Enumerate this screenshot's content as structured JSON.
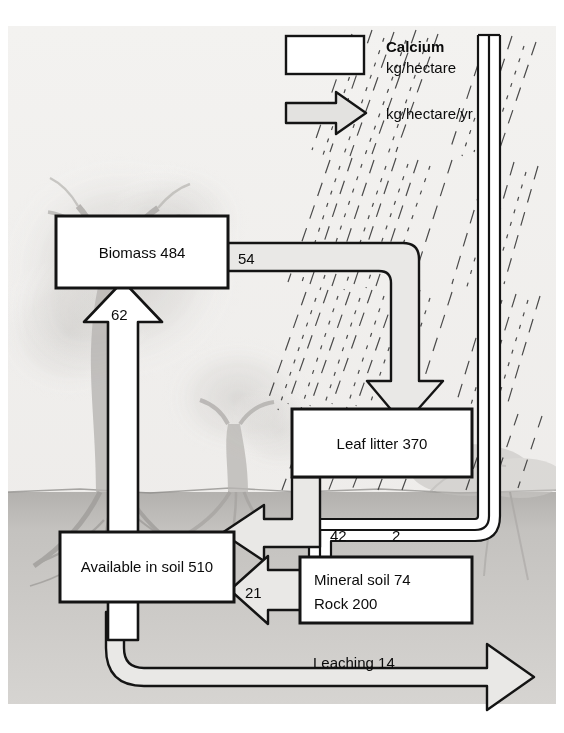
{
  "figure": {
    "background_scene": "pencil-sketch forest with trees, roots and soil layer, rain hatching at upper right"
  },
  "legend": {
    "box_title": "Calcium",
    "box_unit": "kg/hectare",
    "arrow_unit": "kg/hectare/yr"
  },
  "pools": [
    {
      "id": "biomass",
      "label": "Biomass 484"
    },
    {
      "id": "leaf_litter",
      "label": "Leaf litter 370"
    },
    {
      "id": "available_soil",
      "label": "Available in soil 510"
    },
    {
      "id": "mineral_rock",
      "line1": "Mineral soil 74",
      "line2": "Rock 200"
    }
  ],
  "flows": [
    {
      "id": "biomass_to_litter",
      "label": "54"
    },
    {
      "id": "soil_to_biomass",
      "label": "62"
    },
    {
      "id": "litter_to_soil",
      "label": "42"
    },
    {
      "id": "rain_to_soil",
      "label": "2"
    },
    {
      "id": "rock_to_soil",
      "label": "21"
    },
    {
      "id": "leaching",
      "label": "Leaching 14"
    }
  ],
  "colors": {
    "ink": "#0b0b0b",
    "paper": "#ffffff",
    "panel": "#e9e8e6",
    "soil": "#c9c7c4",
    "arrow_fill": "#e6e5e3",
    "channel_fill": "#ffffff"
  }
}
